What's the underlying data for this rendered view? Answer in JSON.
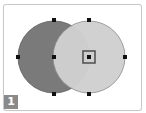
{
  "step_badge": {
    "label": "1",
    "color": "#8a8a8a"
  },
  "shapes": {
    "left_circle": {
      "cx": 54,
      "cy": 57,
      "r": 36,
      "fill": "#7a7a7a",
      "stroke": "#5a5a5a"
    },
    "right_circle": {
      "cx": 89,
      "cy": 57,
      "r": 36,
      "fill": "#cfcfcf",
      "stroke": "#8a8a8a"
    }
  },
  "selection": {
    "target": "right_circle_center",
    "box_color": "#555555"
  },
  "colors": {
    "frame_border": "#c8c8c8",
    "handle": "#111111"
  }
}
